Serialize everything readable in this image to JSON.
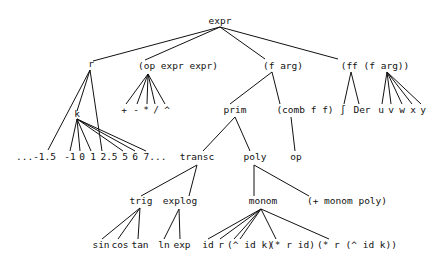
{
  "diagram": {
    "type": "tree",
    "nodes": {
      "expr": "expr",
      "r": "r",
      "k": "k",
      "op_expr_expr": "(op expr expr)",
      "f_arg": "(f arg)",
      "ff_f_arg": "(ff (f arg))",
      "prim": "prim",
      "comb_f_f": "(comb f f)",
      "op": "op",
      "transc": "transc",
      "poly": "poly",
      "trig": "trig",
      "explog": "explog",
      "monom": "monom",
      "plus_monom_poly": "(+ monom poly)",
      "plus": "+",
      "minus": "-",
      "times": "*",
      "divide": "/",
      "power": "^",
      "integral": "∫",
      "der": "Der",
      "u": "u",
      "v": "v",
      "w": "w",
      "x": "x",
      "y": "y",
      "n_neg15": "...-1.5",
      "n_neg1": "-1",
      "n_0": "0",
      "n_1": "1",
      "n_25": "2.5",
      "n_5": "5",
      "n_6": "6",
      "n_7": "7...",
      "sin": "sin",
      "cos": "cos",
      "tan": "tan",
      "ln": "ln",
      "exp": "exp",
      "id": "id",
      "mr": "r",
      "pow_id_k": "(^ id k)",
      "mul_r_id": "(* r id)",
      "mul_r_pow": "(* r (^ id k))"
    },
    "edges": [
      [
        "expr",
        "r"
      ],
      [
        "expr",
        "op_expr_expr"
      ],
      [
        "expr",
        "f_arg"
      ],
      [
        "expr",
        "ff_f_arg"
      ],
      [
        "r",
        "n_neg15"
      ],
      [
        "r",
        "k"
      ],
      [
        "r",
        "n_25"
      ],
      [
        "k",
        "n_neg1"
      ],
      [
        "k",
        "n_0"
      ],
      [
        "k",
        "n_1"
      ],
      [
        "k",
        "n_5"
      ],
      [
        "k",
        "n_6"
      ],
      [
        "k",
        "n_7"
      ],
      [
        "op_expr_expr",
        "plus"
      ],
      [
        "op_expr_expr",
        "minus"
      ],
      [
        "op_expr_expr",
        "times"
      ],
      [
        "op_expr_expr",
        "divide"
      ],
      [
        "op_expr_expr",
        "power"
      ],
      [
        "f_arg",
        "prim"
      ],
      [
        "f_arg",
        "comb_f_f"
      ],
      [
        "ff_f_arg",
        "integral"
      ],
      [
        "ff_f_arg",
        "der"
      ],
      [
        "ff_f_arg",
        "u"
      ],
      [
        "ff_f_arg",
        "v"
      ],
      [
        "ff_f_arg",
        "w"
      ],
      [
        "ff_f_arg",
        "x"
      ],
      [
        "ff_f_arg",
        "y"
      ],
      [
        "prim",
        "transc"
      ],
      [
        "prim",
        "poly"
      ],
      [
        "comb_f_f",
        "op"
      ],
      [
        "transc",
        "trig"
      ],
      [
        "transc",
        "explog"
      ],
      [
        "poly",
        "monom"
      ],
      [
        "poly",
        "plus_monom_poly"
      ],
      [
        "trig",
        "sin"
      ],
      [
        "trig",
        "cos"
      ],
      [
        "trig",
        "tan"
      ],
      [
        "explog",
        "ln"
      ],
      [
        "explog",
        "exp"
      ],
      [
        "monom",
        "id"
      ],
      [
        "monom",
        "mr"
      ],
      [
        "monom",
        "pow_id_k"
      ],
      [
        "monom",
        "mul_r_id"
      ],
      [
        "monom",
        "mul_r_pow"
      ]
    ],
    "colors": {
      "ink": "#111111",
      "background": "#ffffff"
    }
  }
}
